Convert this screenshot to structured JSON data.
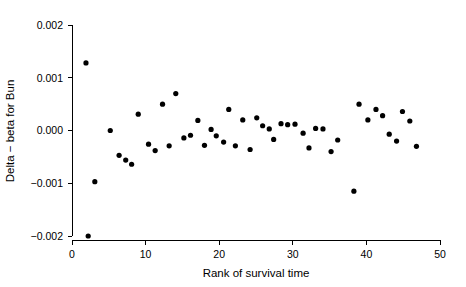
{
  "chart_data": {
    "type": "scatter",
    "title": "",
    "xlabel": "Rank of survival time",
    "ylabel": "Delta − beta for Bun",
    "xlim": [
      0,
      50
    ],
    "ylim": [
      -0.002,
      0.002
    ],
    "xticks": [
      0,
      10,
      20,
      30,
      40,
      50
    ],
    "xtick_labels": [
      "0",
      "10",
      "20",
      "30",
      "40",
      "50"
    ],
    "yticks": [
      -0.002,
      -0.001,
      0.0,
      0.001,
      0.002
    ],
    "ytick_labels": [
      "-0.002",
      "-0.001",
      "0.000",
      "0.001",
      "0.002"
    ],
    "grid": false,
    "legend": "none",
    "marker": "filled-circle",
    "marker_color": "#000000",
    "marker_size_px": 3,
    "n_points": 47,
    "points": [
      {
        "x": 1.9,
        "y": 0.00128
      },
      {
        "x": 2.2,
        "y": -0.002
      },
      {
        "x": 3.1,
        "y": -0.00097
      },
      {
        "x": 5.2,
        "y": 0.0
      },
      {
        "x": 6.4,
        "y": -0.00047
      },
      {
        "x": 7.3,
        "y": -0.00056
      },
      {
        "x": 8.1,
        "y": -0.00064
      },
      {
        "x": 9.0,
        "y": 0.00031
      },
      {
        "x": 10.4,
        "y": -0.00026
      },
      {
        "x": 11.3,
        "y": -0.00038
      },
      {
        "x": 12.3,
        "y": 0.0005
      },
      {
        "x": 13.2,
        "y": -0.00029
      },
      {
        "x": 14.1,
        "y": 0.0007
      },
      {
        "x": 15.2,
        "y": -0.00014
      },
      {
        "x": 16.1,
        "y": -9e-05
      },
      {
        "x": 17.1,
        "y": 0.00019
      },
      {
        "x": 18.0,
        "y": -0.00028
      },
      {
        "x": 18.9,
        "y": 2e-05
      },
      {
        "x": 19.6,
        "y": -0.0001
      },
      {
        "x": 20.6,
        "y": -0.00022
      },
      {
        "x": 21.3,
        "y": 0.0004
      },
      {
        "x": 22.2,
        "y": -0.00029
      },
      {
        "x": 23.2,
        "y": 0.0002
      },
      {
        "x": 24.2,
        "y": -0.00036
      },
      {
        "x": 25.1,
        "y": 0.00024
      },
      {
        "x": 25.9,
        "y": 9e-05
      },
      {
        "x": 26.8,
        "y": 3e-05
      },
      {
        "x": 27.4,
        "y": -0.00017
      },
      {
        "x": 28.4,
        "y": 0.00013
      },
      {
        "x": 29.3,
        "y": 0.00011
      },
      {
        "x": 30.3,
        "y": 0.00012
      },
      {
        "x": 31.4,
        "y": -5e-05
      },
      {
        "x": 32.2,
        "y": -0.00033
      },
      {
        "x": 33.1,
        "y": 4e-05
      },
      {
        "x": 34.1,
        "y": 3e-05
      },
      {
        "x": 35.2,
        "y": -0.0004
      },
      {
        "x": 36.1,
        "y": -0.00018
      },
      {
        "x": 38.3,
        "y": -0.00115
      },
      {
        "x": 39.0,
        "y": 0.0005
      },
      {
        "x": 40.2,
        "y": 0.0002
      },
      {
        "x": 41.3,
        "y": 0.0004
      },
      {
        "x": 42.2,
        "y": 0.00028
      },
      {
        "x": 43.1,
        "y": -7e-05
      },
      {
        "x": 44.1,
        "y": -0.0002
      },
      {
        "x": 44.9,
        "y": 0.00036
      },
      {
        "x": 45.9,
        "y": 0.00018
      },
      {
        "x": 46.8,
        "y": -0.0003
      }
    ]
  }
}
